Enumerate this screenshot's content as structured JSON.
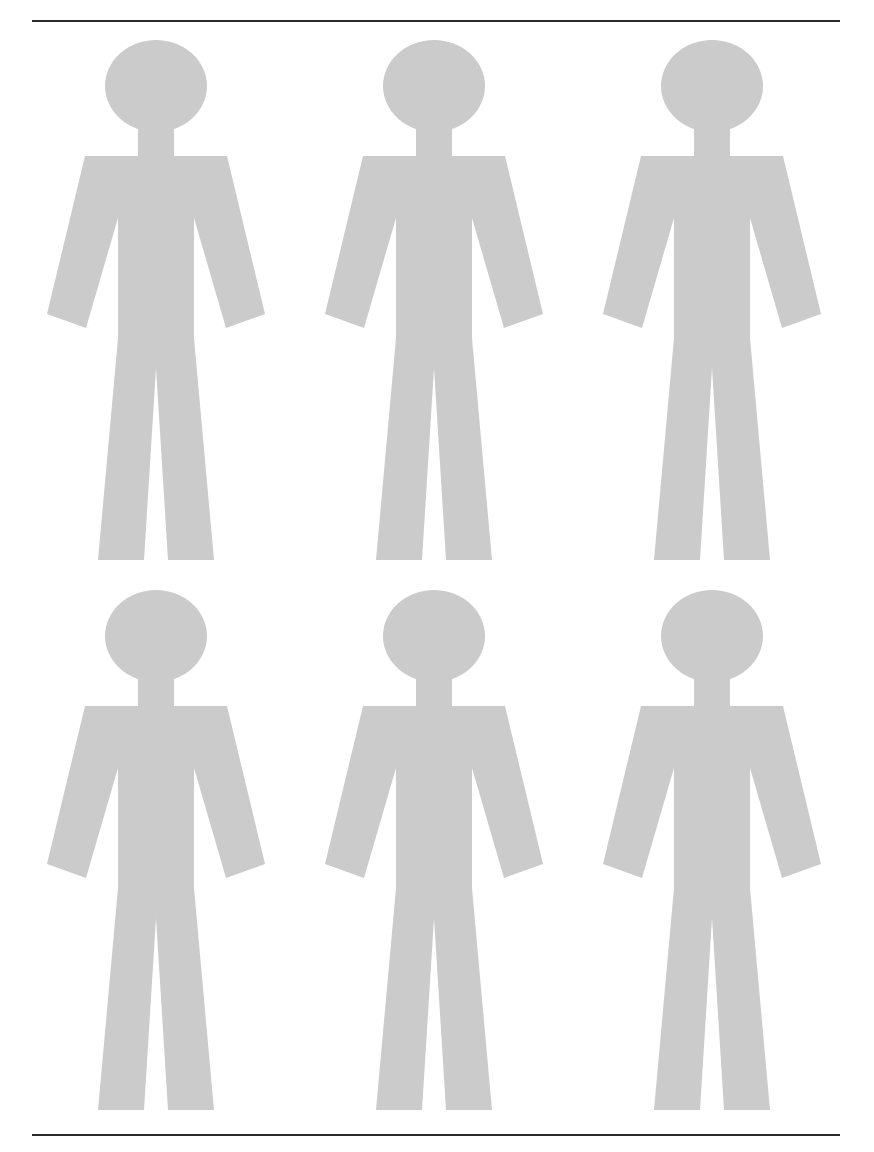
{
  "page": {
    "background_color": "#ffffff",
    "width": 874,
    "height": 1152
  },
  "rules": {
    "color": "#2b2b2b",
    "top_label": "top-horizontal-rule",
    "bottom_label": "bottom-horizontal-rule"
  },
  "figures": {
    "fill_color": "#cbcbcb",
    "icon_name": "human-figure-icon",
    "count": 6,
    "rows": 2,
    "columns": 3,
    "items": [
      {
        "id": "figure-1",
        "row": 1,
        "column": 1,
        "label": "Human figure 1"
      },
      {
        "id": "figure-2",
        "row": 1,
        "column": 2,
        "label": "Human figure 2"
      },
      {
        "id": "figure-3",
        "row": 1,
        "column": 3,
        "label": "Human figure 3"
      },
      {
        "id": "figure-4",
        "row": 2,
        "column": 1,
        "label": "Human figure 4"
      },
      {
        "id": "figure-5",
        "row": 2,
        "column": 2,
        "label": "Human figure 5"
      },
      {
        "id": "figure-6",
        "row": 2,
        "column": 3,
        "label": "Human figure 6"
      }
    ]
  }
}
